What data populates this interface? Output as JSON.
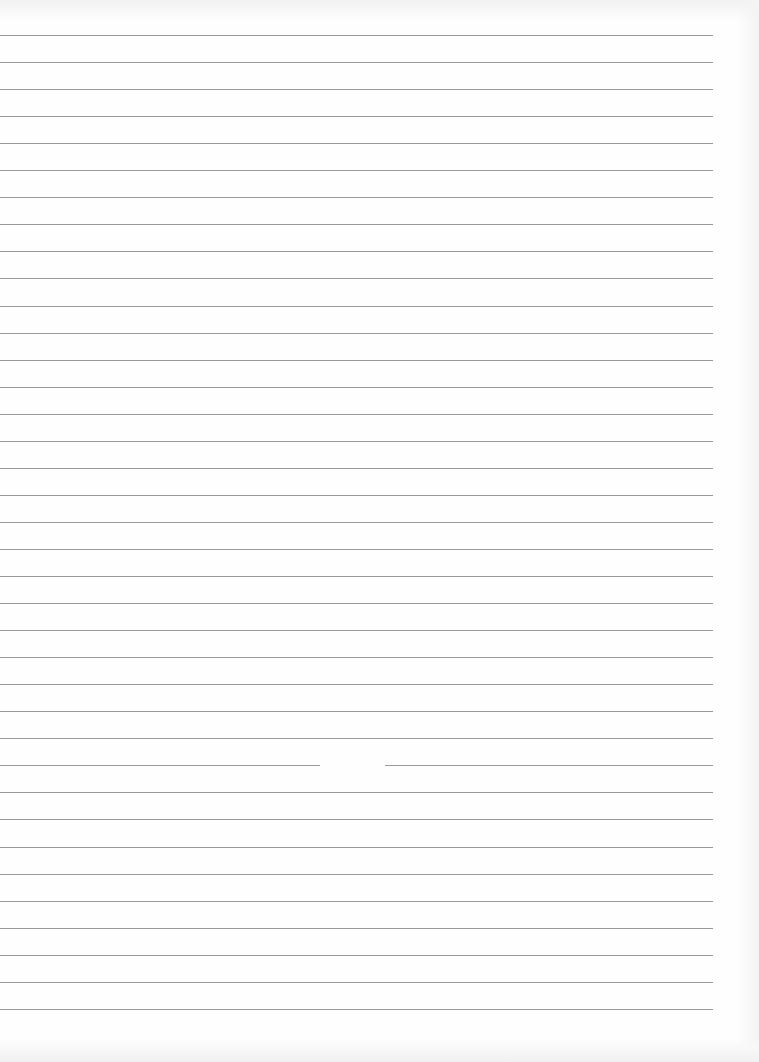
{
  "page": {
    "type": "lined-paper",
    "width": 759,
    "height": 1062,
    "background": "#fefefe",
    "line_color": "#9a9a9a"
  },
  "rules": {
    "count": 37,
    "first_y": 35,
    "spacing": 27.05,
    "x_start": 0,
    "x_end": 713,
    "gaps": [
      {
        "line_index": 27,
        "x_start": 320,
        "x_end": 385
      }
    ]
  }
}
